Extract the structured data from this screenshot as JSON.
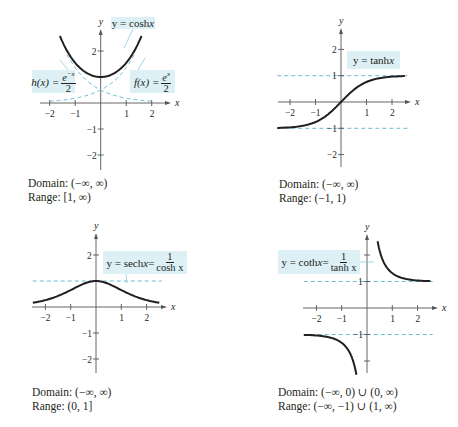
{
  "colors": {
    "curve": "#231f20",
    "axis": "#555555",
    "dashed": "#5ab4d2",
    "label_bg": "#dcf0f6"
  },
  "chart_data": [
    {
      "type": "line",
      "title": "y = cosh x",
      "xlabel": "x",
      "ylabel": "y",
      "xlim": [
        -2.5,
        2.6
      ],
      "ylim": [
        -2.6,
        2.8
      ],
      "x_ticks": [
        -2,
        -1,
        1,
        2
      ],
      "y_ticks": [
        2,
        -1,
        -2
      ],
      "series": [
        {
          "name": "y = cosh x",
          "style": "solid",
          "x": [
            -1.6,
            -1.2,
            -0.8,
            -0.4,
            0,
            0.4,
            0.8,
            1.2,
            1.6
          ],
          "values": [
            2.58,
            1.81,
            1.34,
            1.08,
            1.0,
            1.08,
            1.34,
            1.81,
            2.58
          ]
        },
        {
          "name": "h(x) = e^-x / 2",
          "style": "dashed",
          "x": [
            -2.5,
            -2,
            -1.5,
            -1,
            -0.5,
            0,
            0.5,
            1,
            1.5,
            2
          ],
          "values": [
            6.09,
            3.69,
            2.24,
            1.36,
            0.82,
            0.5,
            0.3,
            0.18,
            0.11,
            0.07
          ]
        },
        {
          "name": "f(x) = e^x / 2",
          "style": "dashed",
          "x": [
            -2,
            -1.5,
            -1,
            -0.5,
            0,
            0.5,
            1,
            1.5,
            2,
            2.5
          ],
          "values": [
            0.07,
            0.11,
            0.18,
            0.3,
            0.5,
            0.82,
            1.36,
            2.24,
            3.69,
            6.09
          ]
        }
      ],
      "domain": "(−∞, ∞)",
      "range": "[1, ∞)"
    },
    {
      "type": "line",
      "title": "y = tanh x",
      "xlabel": "x",
      "ylabel": "y",
      "xlim": [
        -2.5,
        2.6
      ],
      "ylim": [
        -2.6,
        2.8
      ],
      "x_ticks": [
        -2,
        -1,
        1,
        2
      ],
      "y_ticks": [
        2,
        1,
        -1,
        -2
      ],
      "asymptotes": [
        1,
        -1
      ],
      "series": [
        {
          "name": "y = tanh x",
          "style": "solid",
          "x": [
            -2.5,
            -2,
            -1.5,
            -1,
            -0.5,
            0,
            0.5,
            1,
            1.5,
            2,
            2.5
          ],
          "values": [
            -0.99,
            -0.96,
            -0.91,
            -0.76,
            -0.46,
            0,
            0.46,
            0.76,
            0.91,
            0.96,
            0.99
          ]
        }
      ],
      "domain": "(−∞, ∞)",
      "range": "(−1, 1)"
    },
    {
      "type": "line",
      "title": "y = sech x = 1 / cosh x",
      "xlabel": "x",
      "ylabel": "y",
      "xlim": [
        -2.5,
        2.6
      ],
      "ylim": [
        -2.6,
        2.8
      ],
      "x_ticks": [
        -2,
        -1,
        1,
        2
      ],
      "y_ticks": [
        2,
        -1,
        -2
      ],
      "asymptotes": [
        1
      ],
      "series": [
        {
          "name": "y = sech x",
          "style": "solid",
          "x": [
            -2.5,
            -2,
            -1.5,
            -1,
            -0.5,
            0,
            0.5,
            1,
            1.5,
            2,
            2.5
          ],
          "values": [
            0.16,
            0.27,
            0.43,
            0.65,
            0.89,
            1.0,
            0.89,
            0.65,
            0.43,
            0.27,
            0.16
          ]
        }
      ],
      "domain": "(−∞, ∞)",
      "range": "(0, 1]"
    },
    {
      "type": "line",
      "title": "y = coth x = 1 / tanh x",
      "xlabel": "x",
      "ylabel": "y",
      "xlim": [
        -2.5,
        2.6
      ],
      "ylim": [
        -2.6,
        2.8
      ],
      "x_ticks": [
        -2,
        -1,
        1,
        2
      ],
      "y_ticks": [
        1,
        -1
      ],
      "asymptotes": [
        1,
        -1
      ],
      "series": [
        {
          "name": "y = coth x (x>0)",
          "style": "solid",
          "x": [
            0.42,
            0.6,
            0.8,
            1,
            1.5,
            2,
            2.5
          ],
          "values": [
            2.5,
            1.86,
            1.51,
            1.31,
            1.1,
            1.04,
            1.01
          ]
        },
        {
          "name": "y = coth x (x<0)",
          "style": "solid",
          "x": [
            -2.5,
            -2,
            -1.5,
            -1,
            -0.8,
            -0.6,
            -0.42
          ],
          "values": [
            -1.01,
            -1.04,
            -1.1,
            -1.31,
            -1.51,
            -1.86,
            -2.5
          ]
        }
      ],
      "domain": "(−∞, 0) ∪ (0, ∞)",
      "range": "(−∞, −1) ∪ (1, ∞)"
    }
  ],
  "plots": [
    {
      "labels": {
        "main": {
          "lhs": "y = cosh ",
          "var": "x"
        },
        "h": {
          "lhs": "h(x) = ",
          "num": "e",
          "num_sup": "−x",
          "den": "2"
        },
        "f": {
          "lhs": "f(x) = ",
          "num": "e",
          "num_sup": "x",
          "den": "2"
        }
      },
      "caption": {
        "domain": "Domain:  (−∞, ∞)",
        "range": "Range:  [1, ∞)"
      }
    },
    {
      "labels": {
        "main": {
          "lhs": "y = tanh ",
          "var": "x"
        }
      },
      "caption": {
        "domain": "Domain:  (−∞, ∞)",
        "range": "Range:  (−1, 1)"
      }
    },
    {
      "labels": {
        "main": {
          "lhs": "y = sech ",
          "var": "x",
          "eq": " = ",
          "num": "1",
          "den": "cosh x"
        }
      },
      "caption": {
        "domain": "Domain:  (−∞, ∞)",
        "range": "Range:  (0, 1]"
      }
    },
    {
      "labels": {
        "main": {
          "lhs": "y = coth ",
          "var": "x",
          "eq": " = ",
          "num": "1",
          "den": "tanh x"
        }
      },
      "caption": {
        "domain": "Domain:  (−∞, 0) ∪ (0, ∞)",
        "range": "Range:  (−∞, −1) ∪ (1, ∞)"
      }
    }
  ]
}
